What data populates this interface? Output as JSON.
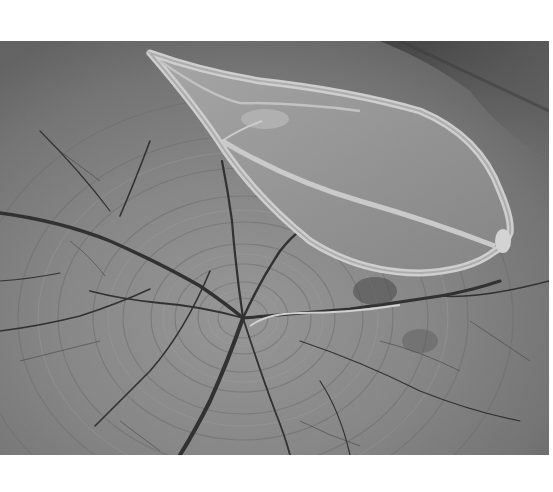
{
  "image": {
    "kind": "photograph",
    "subject": "dried seed pod on cracked tree stump",
    "color_mode": "grayscale",
    "canvas": {
      "width": 553,
      "height": 492,
      "background": "#ffffff"
    },
    "photo_bounds": {
      "x": 0,
      "y": 41,
      "width": 549,
      "height": 414
    },
    "tones": {
      "wood_base": "#7a7a7a",
      "wood_light": "#a8a8a8",
      "wood_dark": "#4a4a4a",
      "crack": "#1e1e1e",
      "pod_fill": "#9a9a9a",
      "pod_rim": "#e6e6e6",
      "top_right_shadow": "#3a3a3a"
    },
    "features": {
      "pith_center": {
        "x": 243,
        "y": 277
      },
      "pod_tip": {
        "x": 150,
        "y": 12
      },
      "pod_end": {
        "x": 510,
        "y": 190
      },
      "fiber_strand": {
        "from_x": 250,
        "from_y": 285,
        "to_x": 400,
        "to_y": 271
      }
    }
  }
}
